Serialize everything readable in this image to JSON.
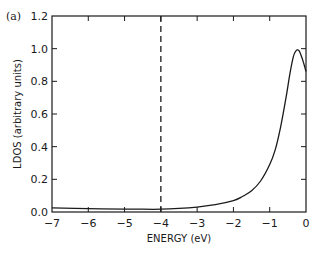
{
  "chart_data": {
    "type": "line",
    "panel_label": "(a)",
    "title": "",
    "xlabel": "ENERGY (eV)",
    "ylabel": "LDOS (arbitrary units)",
    "xlim": [
      -7,
      0
    ],
    "ylim": [
      0,
      1.2
    ],
    "x_ticks": [
      -7,
      -6,
      -5,
      -4,
      -3,
      -2,
      -1,
      0
    ],
    "x_tick_labels": [
      "−7",
      "−6",
      "−5",
      "−4",
      "−3",
      "−2",
      "−1",
      "0"
    ],
    "y_ticks": [
      0.0,
      0.2,
      0.4,
      0.6,
      0.8,
      1.0,
      1.2
    ],
    "y_tick_labels": [
      "0.0",
      "0.2",
      "0.4",
      "0.6",
      "0.8",
      "1.0",
      "1.2"
    ],
    "grid": false,
    "legend": null,
    "series": [
      {
        "name": "LDOS",
        "style": "solid",
        "x": [
          -7.0,
          -6.0,
          -5.0,
          -4.5,
          -4.0,
          -3.5,
          -3.0,
          -2.5,
          -2.0,
          -1.75,
          -1.5,
          -1.25,
          -1.0,
          -0.85,
          -0.7,
          -0.55,
          -0.45,
          -0.35,
          -0.28,
          -0.2,
          -0.12,
          -0.05,
          0.0
        ],
        "y": [
          0.025,
          0.02,
          0.018,
          0.017,
          0.017,
          0.022,
          0.03,
          0.045,
          0.07,
          0.095,
          0.13,
          0.19,
          0.29,
          0.38,
          0.52,
          0.7,
          0.84,
          0.95,
          0.985,
          0.99,
          0.95,
          0.9,
          0.86
        ]
      }
    ],
    "annotations": [
      {
        "type": "vertical_line",
        "x": -4.0,
        "style": "dashed"
      }
    ]
  }
}
